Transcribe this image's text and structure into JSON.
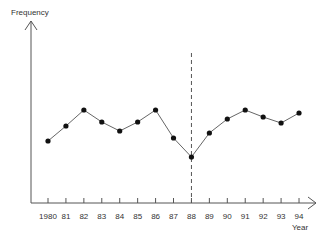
{
  "chart_data": {
    "type": "line",
    "title": "",
    "xlabel": "Year",
    "ylabel": "Frequency",
    "categories": [
      "1980",
      "81",
      "82",
      "83",
      "84",
      "85",
      "86",
      "87",
      "88",
      "89",
      "90",
      "91",
      "92",
      "93",
      "94"
    ],
    "series": [
      {
        "name": "Frequency",
        "values": [
          141,
          126,
          110,
          122,
          131,
          122,
          110,
          138,
          157,
          133,
          119,
          110,
          117,
          123,
          113
        ]
      }
    ],
    "values_note": "no numeric y-axis scale shown; values are relative vertical positions (screen y, lower = higher frequency)",
    "annotations": [
      {
        "type": "vertical-dashed-line",
        "at": "88"
      }
    ],
    "grid": false,
    "legend": null
  },
  "axes": {
    "y_label": "Frequency",
    "x_label": "Year"
  }
}
